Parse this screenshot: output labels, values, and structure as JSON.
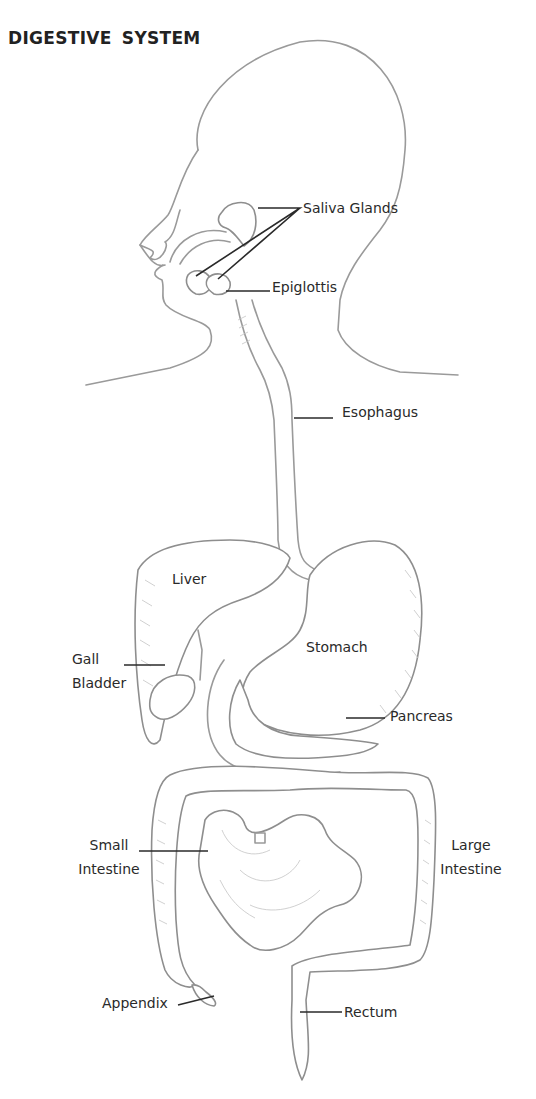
{
  "title": "DIGESTIVE SYSTEM",
  "labels": {
    "saliva_glands": "Saliva Glands",
    "epiglottis": "Epiglottis",
    "esophagus": "Esophagus",
    "liver": "Liver",
    "gall_bladder_line1": "Gall",
    "gall_bladder_line2": "Bladder",
    "stomach": "Stomach",
    "pancreas": "Pancreas",
    "small_intestine_line1": "Small",
    "small_intestine_line2": "Intestine",
    "large_intestine_line1": "Large",
    "large_intestine_line2": "Intestine",
    "appendix": "Appendix",
    "rectum": "Rectum"
  },
  "colors": {
    "line": "#9a9a9a",
    "text": "#2a2a2a",
    "background": "#ffffff"
  }
}
